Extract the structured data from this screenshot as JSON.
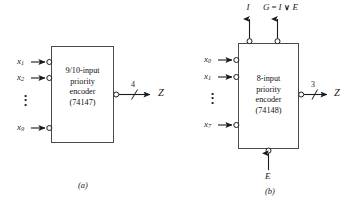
{
  "figure": {
    "background_color": "#ffffff",
    "line_color": "#1a1a1a",
    "diagrams": [
      {
        "id": "a",
        "caption": "(a)",
        "block_lines": [
          "9/10-input",
          "priority",
          "encoder",
          "(74147)"
        ],
        "inputs": [
          {
            "name": "x",
            "sub": "1"
          },
          {
            "name": "x",
            "sub": "2"
          },
          {
            "name": "x",
            "sub": "9"
          }
        ],
        "input_ellipsis": "⋮",
        "output": {
          "label": "Z",
          "bus_width": "4"
        }
      },
      {
        "id": "b",
        "caption": "(b)",
        "block_lines": [
          "8-input",
          "priority",
          "encoder",
          "(74148)"
        ],
        "inputs": [
          {
            "name": "x",
            "sub": "0"
          },
          {
            "name": "x",
            "sub": "1"
          },
          {
            "name": "x",
            "sub": "7"
          }
        ],
        "input_ellipsis": "⋮",
        "output": {
          "label": "Z",
          "bus_width": "3"
        },
        "top_outputs": [
          {
            "label": "I"
          },
          {
            "label_g": "G",
            "equals": "=",
            "label_i": "I",
            "or": "∨",
            "label_e": "E"
          }
        ],
        "bottom_input": {
          "label": "E"
        }
      }
    ]
  }
}
